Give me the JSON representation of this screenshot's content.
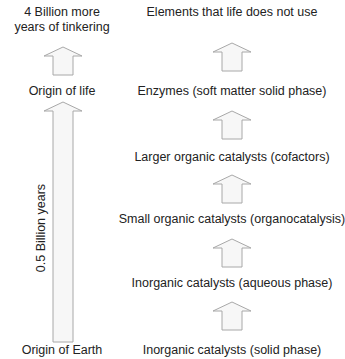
{
  "left_column": {
    "top_label_line1": "4 Billion more",
    "top_label_line2": "years of tinkering",
    "middle_label": "Origin of life",
    "duration_label": "0.5 Billion years",
    "bottom_label": "Origin of Earth"
  },
  "right_column": {
    "steps": [
      "Elements that life does not use",
      "Enzymes (soft matter solid phase)",
      "Larger organic catalysts (cofactors)",
      "Small organic catalysts (organocatalysis)",
      "Inorganic catalysts (aqueous phase)",
      "Inorganic catalysts (solid phase)"
    ]
  },
  "colors": {
    "arrow_fill": "#f7f7f7",
    "arrow_stroke": "#a8a8a8",
    "text": "#222222"
  }
}
